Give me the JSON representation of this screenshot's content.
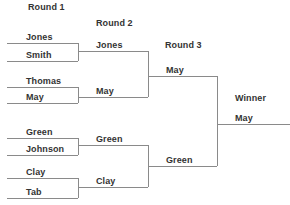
{
  "headers": {
    "round1": "Round 1",
    "round2": "Round 2",
    "round3": "Round 3",
    "winner": "Winner"
  },
  "round1": [
    "Jones",
    "Smith",
    "Thomas",
    "May",
    "Green",
    "Johnson",
    "Clay",
    "Tab"
  ],
  "round2": [
    "Jones",
    "May",
    "Green",
    "Clay"
  ],
  "round3": [
    "May",
    "Green"
  ],
  "winner": "May",
  "colors": {
    "line": "#8a8a8a",
    "text": "#333333"
  }
}
